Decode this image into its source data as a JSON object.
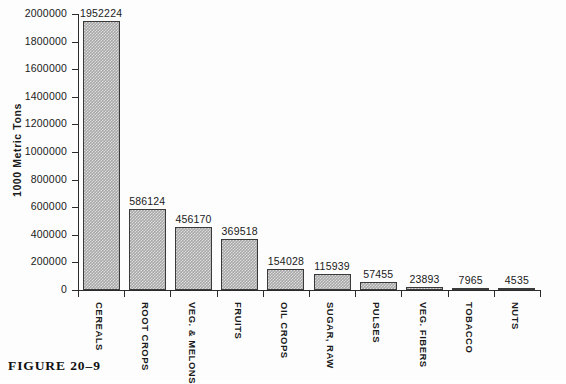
{
  "caption": "FIGURE 20–9",
  "chart_data": {
    "type": "bar",
    "title": "",
    "xlabel": "",
    "ylabel": "1000 Metric Tons",
    "ylim": [
      0,
      2000000
    ],
    "grid": false,
    "legend": false,
    "tick_labels": [
      "0",
      "200000",
      "400000",
      "600000",
      "800000",
      "1000000",
      "1200000",
      "1400000",
      "1600000",
      "1800000",
      "2000000"
    ],
    "tick_values": [
      0,
      200000,
      400000,
      600000,
      800000,
      1000000,
      1200000,
      1400000,
      1600000,
      1800000,
      2000000
    ],
    "categories": [
      "CEREALS",
      "ROOT CROPS",
      "VEG. & MELONS",
      "FRUITS",
      "OIL CROPS",
      "SUGAR, RAW",
      "PULSES",
      "VEG. FIBERS",
      "TOBACCO",
      "NUTS"
    ],
    "values": [
      1952224,
      586124,
      456170,
      369518,
      154028,
      115939,
      57455,
      23893,
      7965,
      4535
    ],
    "value_labels": [
      "1952224",
      "586124",
      "456170",
      "369518",
      "154028",
      "115939",
      "57455",
      "23893",
      "7965",
      "4535"
    ],
    "bar_color": "#a8a8a8",
    "bar_edge_color": "#3a3a3a",
    "axis_color": "#2b2b2b"
  }
}
